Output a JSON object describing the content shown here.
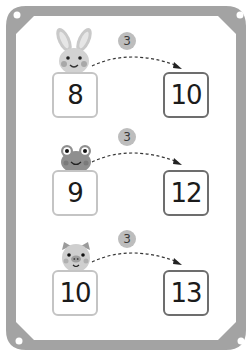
{
  "worksheet": {
    "frame_color": "#9e9e9e",
    "rows": [
      {
        "animal": "rabbit-icon",
        "step": "3",
        "start": "8",
        "end": "10"
      },
      {
        "animal": "frog-icon",
        "step": "3",
        "start": "9",
        "end": "12"
      },
      {
        "animal": "pig-icon",
        "step": "3",
        "start": "10",
        "end": "13"
      }
    ]
  }
}
